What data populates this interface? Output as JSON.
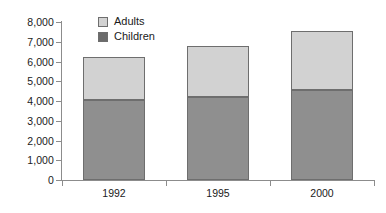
{
  "chart_data": {
    "type": "bar",
    "title": "",
    "subtitle": "",
    "xlabel": "",
    "ylabel": "",
    "stacked": true,
    "grid": false,
    "legend_position": "top-left-inside",
    "categories": [
      "1992",
      "1995",
      "2000"
    ],
    "series": [
      {
        "name": "Children",
        "color": "#8f8f8f",
        "values": [
          4050,
          4180,
          4540
        ]
      },
      {
        "name": "Adults",
        "color": "#d2d2d2",
        "values": [
          2200,
          2600,
          3020
        ]
      }
    ],
    "totals": [
      6250,
      6780,
      7560
    ],
    "ylim": [
      0,
      8000
    ],
    "ytick_values": [
      0,
      1000,
      2000,
      3000,
      4000,
      5000,
      6000,
      7000,
      8000
    ],
    "ytick_labels": [
      "0",
      "1,000",
      "2,000",
      "3,000",
      "4,000",
      "5,000",
      "6,000",
      "7,000",
      "8,000"
    ]
  },
  "legend": {
    "items": [
      {
        "label": "Adults",
        "swatch": "light-gray-swatch-icon"
      },
      {
        "label": "Children",
        "swatch": "dark-gray-swatch-icon"
      }
    ]
  },
  "colors": {
    "adults": "#d2d2d2",
    "children": "#8f8f8f",
    "axis": "#8c8c8c",
    "text": "#1a1a1a",
    "background": "#ffffff"
  }
}
